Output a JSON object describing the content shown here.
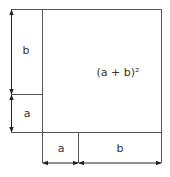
{
  "diagram": {
    "title_formula": "(a + b)²",
    "labels": {
      "left_top": "b",
      "left_bottom": "a",
      "bottom_left": "a",
      "bottom_right": "b"
    },
    "colors": {
      "line": "#555555",
      "text": "#333333",
      "background": "#ffffff"
    }
  }
}
